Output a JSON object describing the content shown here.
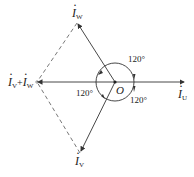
{
  "diagram": {
    "type": "phasor-diagram",
    "origin_label": "O",
    "phasors": [
      {
        "id": "iu",
        "symbol": "I",
        "subscript": "U",
        "angle_deg": 0
      },
      {
        "id": "iw",
        "symbol": "I",
        "subscript": "W",
        "angle_deg": 120
      },
      {
        "id": "iv",
        "symbol": "I",
        "subscript": "V",
        "angle_deg": 240
      },
      {
        "id": "ivw",
        "symbol": "I",
        "subscript": "V",
        "plus": "+",
        "symbol2": "I",
        "subscript2": "W",
        "angle_deg": 180,
        "dashed_construction": true
      }
    ],
    "angles": [
      {
        "label": "120°",
        "between": "iu-iw"
      },
      {
        "label": "120°",
        "between": "iw-iv"
      },
      {
        "label": "120°",
        "between": "iv-iu"
      }
    ],
    "colors": {
      "stroke": "#333333",
      "text": "#222222"
    }
  }
}
